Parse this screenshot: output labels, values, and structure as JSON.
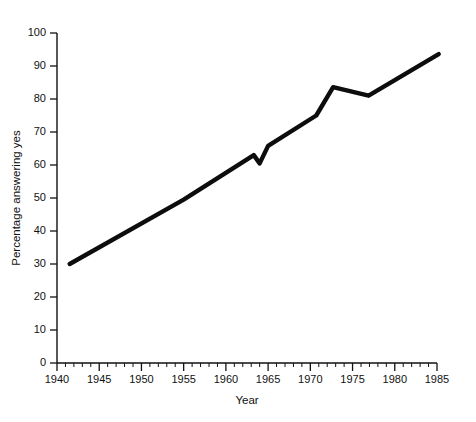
{
  "chart_data": {
    "type": "line",
    "title": "",
    "xlabel": "Year",
    "ylabel": "Percentage answering yes",
    "xlim": [
      1940,
      1985
    ],
    "ylim": [
      0,
      100
    ],
    "grid": false,
    "legend": null,
    "x_ticks": [
      1940,
      1945,
      1950,
      1955,
      1960,
      1965,
      1970,
      1975,
      1980,
      1985
    ],
    "x_tick_labels": [
      "1940",
      "1945",
      "1950",
      "1955",
      "1960",
      "1965",
      "1970",
      "1975",
      "1980",
      "1985"
    ],
    "x_minor_tick_step": 1,
    "y_ticks": [
      0,
      10,
      20,
      30,
      40,
      50,
      60,
      70,
      80,
      90,
      100
    ],
    "y_tick_labels": [
      "0",
      "10",
      "20",
      "30",
      "40",
      "50",
      "60",
      "70",
      "80",
      "90",
      "100"
    ],
    "series": [
      {
        "name": "Percentage answering yes",
        "color": "#0d0d0d",
        "x": [
          1941.5,
          1955.0,
          1963.3,
          1964.0,
          1965.0,
          1970.7,
          1972.7,
          1976.9,
          1985.2
        ],
        "y": [
          30.0,
          49.5,
          63.0,
          60.5,
          65.8,
          75.0,
          83.6,
          81.0,
          93.6
        ]
      }
    ]
  },
  "axes": {
    "y_axis_title": "Percentage answering yes",
    "x_axis_title": "Year"
  }
}
